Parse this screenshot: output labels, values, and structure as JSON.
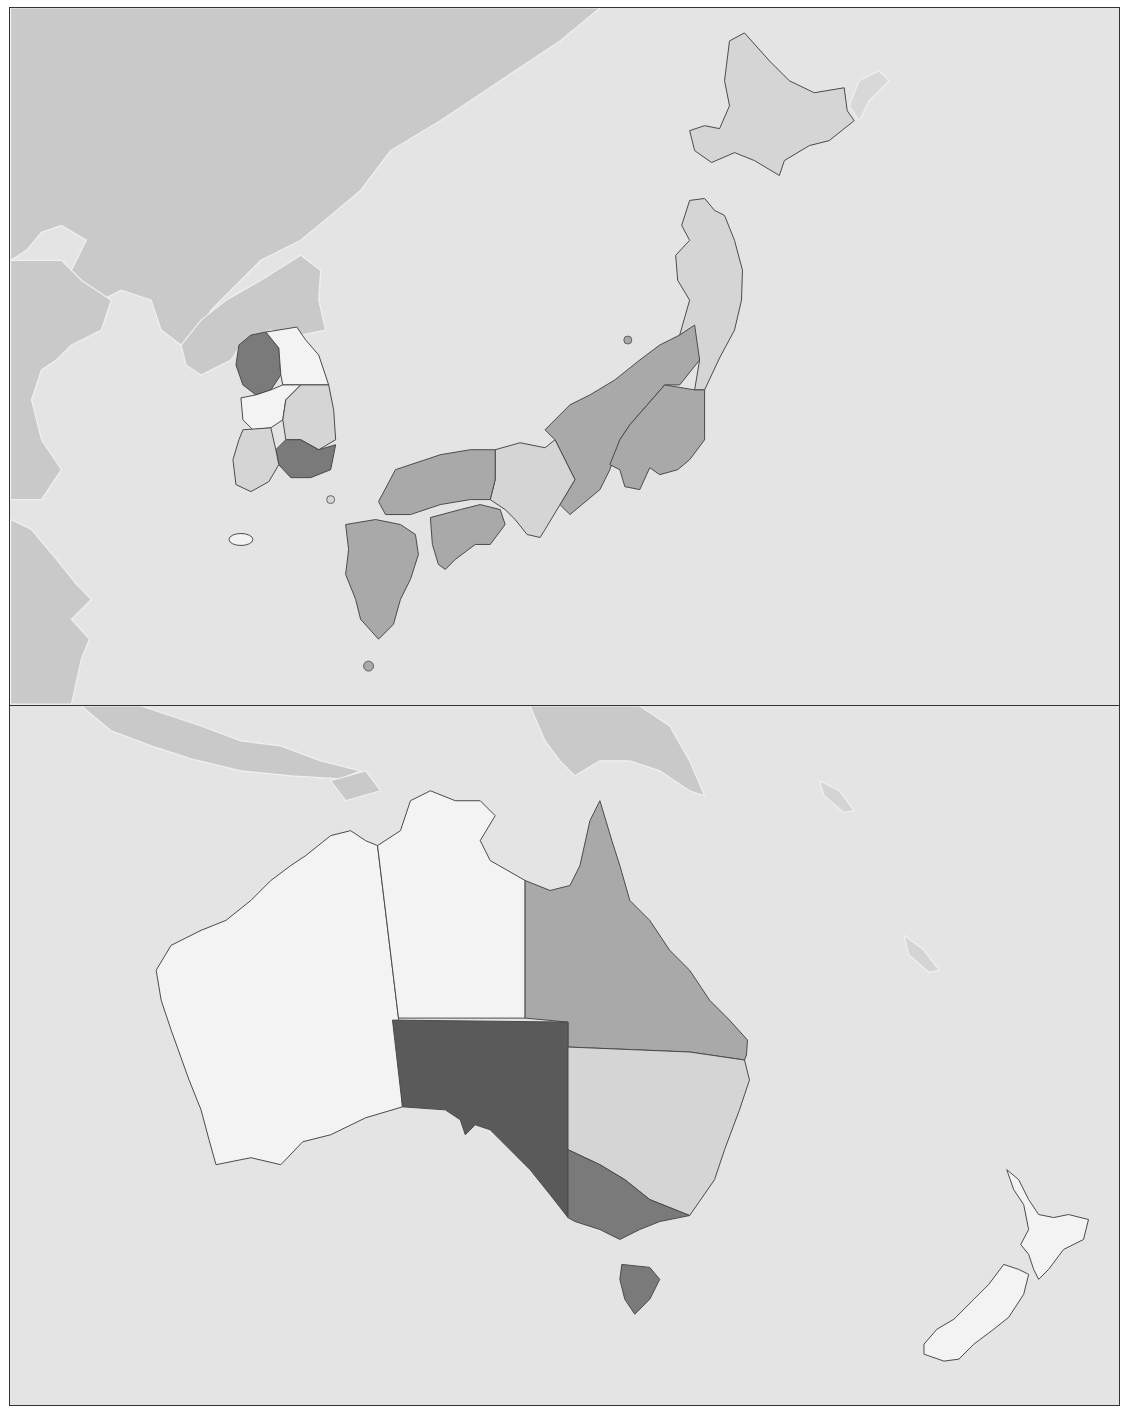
{
  "colors": {
    "ocean": "#e4e4e4",
    "foreign_land": "#c9c9c9",
    "border": "#4a4a4a",
    "class_lightest": "#f3f3f3",
    "class_light": "#d5d5d5",
    "class_medium": "#a9a9a9",
    "class_dark": "#7a7a7a",
    "class_darkest": "#5a5a5a"
  },
  "panels": [
    {
      "id": "east-asia",
      "label": "",
      "regions": [
        {
          "name": "Hokkaido",
          "country": "Japan",
          "shade": "class_light"
        },
        {
          "name": "Tohoku",
          "country": "Japan",
          "shade": "class_light"
        },
        {
          "name": "Chubu",
          "country": "Japan",
          "shade": "class_medium"
        },
        {
          "name": "Kanto",
          "country": "Japan",
          "shade": "class_medium"
        },
        {
          "name": "Kansai",
          "country": "Japan",
          "shade": "class_light"
        },
        {
          "name": "Chugoku",
          "country": "Japan",
          "shade": "class_medium"
        },
        {
          "name": "Shikoku",
          "country": "Japan",
          "shade": "class_medium"
        },
        {
          "name": "Kyushu",
          "country": "Japan",
          "shade": "class_medium"
        },
        {
          "name": "Seoul Capital Area",
          "country": "South Korea",
          "shade": "class_dark"
        },
        {
          "name": "Gangwon",
          "country": "South Korea",
          "shade": "class_lightest"
        },
        {
          "name": "Chungcheong",
          "country": "South Korea",
          "shade": "class_lightest"
        },
        {
          "name": "Gyeongbuk",
          "country": "South Korea",
          "shade": "class_light"
        },
        {
          "name": "Gyeongnam",
          "country": "South Korea",
          "shade": "class_dark"
        },
        {
          "name": "Jeolla",
          "country": "South Korea",
          "shade": "class_light"
        },
        {
          "name": "Jeju",
          "country": "South Korea",
          "shade": "class_lightest"
        }
      ]
    },
    {
      "id": "oceania",
      "label": "",
      "regions": [
        {
          "name": "Western Australia",
          "country": "Australia",
          "shade": "class_lightest"
        },
        {
          "name": "Northern Territory",
          "country": "Australia",
          "shade": "class_lightest"
        },
        {
          "name": "Queensland",
          "country": "Australia",
          "shade": "class_medium"
        },
        {
          "name": "South Australia",
          "country": "Australia",
          "shade": "class_darkest"
        },
        {
          "name": "New South Wales",
          "country": "Australia",
          "shade": "class_light"
        },
        {
          "name": "Victoria",
          "country": "Australia",
          "shade": "class_dark"
        },
        {
          "name": "Tasmania",
          "country": "Australia",
          "shade": "class_dark"
        },
        {
          "name": "New Zealand North Island",
          "country": "New Zealand",
          "shade": "class_lightest"
        },
        {
          "name": "New Zealand South Island",
          "country": "New Zealand",
          "shade": "class_lightest"
        }
      ]
    }
  ]
}
